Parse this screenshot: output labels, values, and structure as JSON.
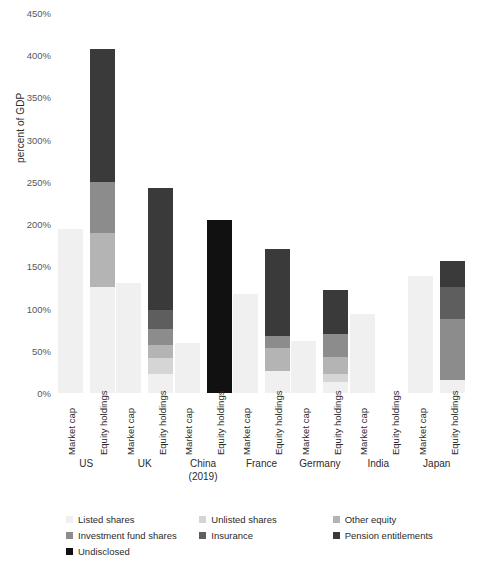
{
  "chart_data": {
    "type": "bar",
    "stacked": true,
    "title": "",
    "subtitle": "",
    "xlabel": "",
    "ylabel": "percent of GDP",
    "ylim": [
      0,
      450
    ],
    "ytick_step": 50,
    "ytick_labels": [
      "0%",
      "50%",
      "100%",
      "150%",
      "200%",
      "250%",
      "300%",
      "350%",
      "400%",
      "450%"
    ],
    "ytick_values": [
      0,
      50,
      100,
      150,
      200,
      250,
      300,
      350,
      400,
      450
    ],
    "grid": false,
    "legend_position": "bottom",
    "value_unit": "percent of GDP",
    "bar_types": [
      "Market cap",
      "Equity holdings"
    ],
    "categories": [
      "US",
      "UK",
      "China (2019)",
      "France",
      "Germany",
      "India",
      "Japan"
    ],
    "series": [
      {
        "name": "Listed shares",
        "color": "#f0f0f0"
      },
      {
        "name": "Unlisted shares",
        "color": "#d5d5d5"
      },
      {
        "name": "Other equity",
        "color": "#b4b4b4"
      },
      {
        "name": "Investment fund shares",
        "color": "#8c8c8c"
      },
      {
        "name": "Insurance",
        "color": "#5e5e5e"
      },
      {
        "name": "Pension entitlements",
        "color": "#3a3a3a"
      },
      {
        "name": "Undisclosed",
        "color": "#111111"
      }
    ],
    "groups": [
      {
        "category": "US",
        "category_lines": [
          "US"
        ],
        "bars": [
          {
            "label": "Market cap",
            "total": 194,
            "segments": [
              {
                "series": "Listed shares",
                "value": 194
              }
            ]
          },
          {
            "label": "Equity holdings",
            "total": 408,
            "segments": [
              {
                "series": "Listed shares",
                "value": 125
              },
              {
                "series": "Other equity",
                "value": 65
              },
              {
                "series": "Investment fund shares",
                "value": 60
              },
              {
                "series": "Pension entitlements",
                "value": 158
              }
            ]
          }
        ]
      },
      {
        "category": "UK",
        "category_lines": [
          "UK"
        ],
        "bars": [
          {
            "label": "Market cap",
            "total": 130,
            "segments": [
              {
                "series": "Listed shares",
                "value": 130
              }
            ]
          },
          {
            "label": "Equity holdings",
            "total": 243,
            "segments": [
              {
                "series": "Listed shares",
                "value": 22
              },
              {
                "series": "Unlisted shares",
                "value": 19
              },
              {
                "series": "Other equity",
                "value": 16
              },
              {
                "series": "Investment fund shares",
                "value": 19
              },
              {
                "series": "Insurance",
                "value": 22
              },
              {
                "series": "Pension entitlements",
                "value": 145
              }
            ]
          }
        ]
      },
      {
        "category": "China (2019)",
        "category_lines": [
          "China",
          "(2019)"
        ],
        "bars": [
          {
            "label": "Market cap",
            "total": 59,
            "segments": [
              {
                "series": "Listed shares",
                "value": 59
              }
            ]
          },
          {
            "label": "Equity holdings",
            "total": 205,
            "segments": [
              {
                "series": "Undisclosed",
                "value": 205
              }
            ]
          }
        ]
      },
      {
        "category": "France",
        "category_lines": [
          "France"
        ],
        "bars": [
          {
            "label": "Market cap",
            "total": 117,
            "segments": [
              {
                "series": "Listed shares",
                "value": 117
              }
            ]
          },
          {
            "label": "Equity holdings",
            "total": 170,
            "segments": [
              {
                "series": "Listed shares",
                "value": 26
              },
              {
                "series": "Other equity",
                "value": 27
              },
              {
                "series": "Investment fund shares",
                "value": 14
              },
              {
                "series": "Pension entitlements",
                "value": 103
              }
            ]
          }
        ]
      },
      {
        "category": "Germany",
        "category_lines": [
          "Germany"
        ],
        "bars": [
          {
            "label": "Market cap",
            "total": 62,
            "segments": [
              {
                "series": "Listed shares",
                "value": 62
              }
            ]
          },
          {
            "label": "Equity holdings",
            "total": 122,
            "segments": [
              {
                "series": "Listed shares",
                "value": 13
              },
              {
                "series": "Unlisted shares",
                "value": 10
              },
              {
                "series": "Other equity",
                "value": 20
              },
              {
                "series": "Investment fund shares",
                "value": 27
              },
              {
                "series": "Pension entitlements",
                "value": 52
              }
            ]
          }
        ]
      },
      {
        "category": "India",
        "category_lines": [
          "India"
        ],
        "bars": [
          {
            "label": "Market cap",
            "total": 94,
            "segments": [
              {
                "series": "Listed shares",
                "value": 94
              }
            ]
          },
          {
            "label": "Equity holdings",
            "total": 0,
            "segments": []
          }
        ]
      },
      {
        "category": "Japan",
        "category_lines": [
          "Japan"
        ],
        "bars": [
          {
            "label": "Market cap",
            "total": 139,
            "segments": [
              {
                "series": "Listed shares",
                "value": 139
              }
            ]
          },
          {
            "label": "Equity holdings",
            "total": 156,
            "segments": [
              {
                "series": "Listed shares",
                "value": 16
              },
              {
                "series": "Investment fund shares",
                "value": 72
              },
              {
                "series": "Insurance",
                "value": 38
              },
              {
                "series": "Pension entitlements",
                "value": 30
              }
            ]
          }
        ]
      }
    ]
  },
  "legend": {
    "items": [
      {
        "label": "Listed shares",
        "color": "#f0f0f0"
      },
      {
        "label": "Unlisted shares",
        "color": "#d5d5d5"
      },
      {
        "label": "Other equity",
        "color": "#b4b4b4"
      },
      {
        "label": "Investment fund shares",
        "color": "#8c8c8c"
      },
      {
        "label": "Insurance",
        "color": "#5e5e5e"
      },
      {
        "label": "Pension entitlements",
        "color": "#3a3a3a"
      },
      {
        "label": "Undisclosed",
        "color": "#111111"
      }
    ]
  }
}
